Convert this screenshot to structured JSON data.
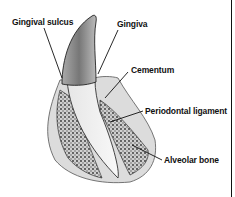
{
  "diagram": {
    "labels": [
      {
        "id": "gingival-sulcus",
        "text": "Gingival sulcus"
      },
      {
        "id": "gingiva",
        "text": "Gingiva"
      },
      {
        "id": "cementum",
        "text": "Cementum"
      },
      {
        "id": "periodontal-ligament",
        "text": "Periodontal ligament"
      },
      {
        "id": "alveolar-bone",
        "text": "Alveolar bone"
      }
    ]
  }
}
